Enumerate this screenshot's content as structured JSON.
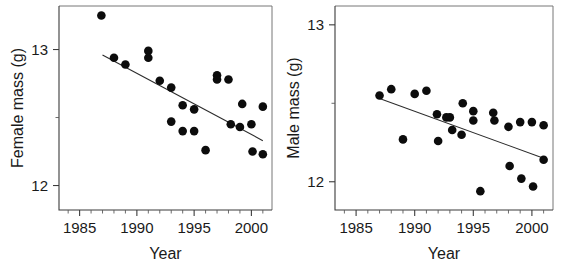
{
  "figure": {
    "panel_count": 2,
    "background": "#ffffff",
    "point_color": "#0c0c0c",
    "line_color": "#2b2b2b",
    "axis_color": "#3b3b3b"
  },
  "chart_data": [
    {
      "type": "scatter",
      "panel": "left",
      "title": "",
      "xlabel": "Year",
      "ylabel": "Female mass (g)",
      "xlim": [
        1983.2,
        2001.8
      ],
      "ylim": [
        11.82,
        13.32
      ],
      "grid": false,
      "legend": "none",
      "xticks": [
        1985,
        1990,
        1995,
        2000
      ],
      "xticklabels": [
        "1985",
        "1990",
        "1995",
        "2000"
      ],
      "xminorticks": [
        1984,
        1986,
        1987,
        1988,
        1989,
        1991,
        1992,
        1993,
        1994,
        1996,
        1997,
        1998,
        1999,
        2001
      ],
      "yticks": [
        12,
        13
      ],
      "yticklabels": [
        "12",
        "13"
      ],
      "yminorticks": [
        12.5
      ],
      "points": [
        {
          "x": 1986.9,
          "y": 13.25
        },
        {
          "x": 1988.0,
          "y": 12.94
        },
        {
          "x": 1989.0,
          "y": 12.89
        },
        {
          "x": 1991.0,
          "y": 12.99
        },
        {
          "x": 1991.0,
          "y": 12.94
        },
        {
          "x": 1992.0,
          "y": 12.77
        },
        {
          "x": 1993.0,
          "y": 12.72
        },
        {
          "x": 1993.0,
          "y": 12.47
        },
        {
          "x": 1994.0,
          "y": 12.59
        },
        {
          "x": 1994.0,
          "y": 12.4
        },
        {
          "x": 1995.0,
          "y": 12.56
        },
        {
          "x": 1995.0,
          "y": 12.4
        },
        {
          "x": 1996.0,
          "y": 12.26
        },
        {
          "x": 1997.0,
          "y": 12.81
        },
        {
          "x": 1997.0,
          "y": 12.78
        },
        {
          "x": 1998.0,
          "y": 12.78
        },
        {
          "x": 1998.2,
          "y": 12.45
        },
        {
          "x": 1999.0,
          "y": 12.43
        },
        {
          "x": 1999.2,
          "y": 12.6
        },
        {
          "x": 2000.0,
          "y": 12.45
        },
        {
          "x": 2000.1,
          "y": 12.25
        },
        {
          "x": 2001.0,
          "y": 12.58
        },
        {
          "x": 2001.0,
          "y": 12.23
        }
      ],
      "fit_line": {
        "x0": 1987.0,
        "y0": 12.96,
        "x1": 2001.0,
        "y1": 12.33,
        "description": "negative linear trend"
      }
    },
    {
      "type": "scatter",
      "panel": "right",
      "title": "",
      "xlabel": "Year",
      "ylabel": "Male mass (g)",
      "xlim": [
        1983.2,
        2001.8
      ],
      "ylim": [
        11.82,
        13.12
      ],
      "grid": false,
      "legend": "none",
      "xticks": [
        1985,
        1990,
        1995,
        2000
      ],
      "xticklabels": [
        "1985",
        "1990",
        "1995",
        "2000"
      ],
      "xminorticks": [
        1984,
        1986,
        1987,
        1988,
        1989,
        1991,
        1992,
        1993,
        1994,
        1996,
        1997,
        1998,
        1999,
        2001
      ],
      "yticks": [
        12,
        13
      ],
      "yticklabels": [
        "12",
        "13"
      ],
      "yminorticks": [
        12.5
      ],
      "points": [
        {
          "x": 1987.0,
          "y": 12.55
        },
        {
          "x": 1988.0,
          "y": 12.59
        },
        {
          "x": 1989.0,
          "y": 12.27
        },
        {
          "x": 1990.0,
          "y": 12.56
        },
        {
          "x": 1991.0,
          "y": 12.58
        },
        {
          "x": 1991.9,
          "y": 12.43
        },
        {
          "x": 1992.0,
          "y": 12.26
        },
        {
          "x": 1992.7,
          "y": 12.41
        },
        {
          "x": 1993.0,
          "y": 12.41
        },
        {
          "x": 1993.2,
          "y": 12.33
        },
        {
          "x": 1994.0,
          "y": 12.3
        },
        {
          "x": 1994.1,
          "y": 12.5
        },
        {
          "x": 1995.0,
          "y": 12.45
        },
        {
          "x": 1995.0,
          "y": 12.39
        },
        {
          "x": 1995.6,
          "y": 11.94
        },
        {
          "x": 1996.7,
          "y": 12.44
        },
        {
          "x": 1996.8,
          "y": 12.39
        },
        {
          "x": 1998.0,
          "y": 12.35
        },
        {
          "x": 1998.1,
          "y": 12.1
        },
        {
          "x": 1999.0,
          "y": 12.38
        },
        {
          "x": 1999.1,
          "y": 12.02
        },
        {
          "x": 2000.0,
          "y": 12.38
        },
        {
          "x": 2000.1,
          "y": 11.97
        },
        {
          "x": 2001.0,
          "y": 12.36
        },
        {
          "x": 2001.0,
          "y": 12.14
        }
      ],
      "fit_line": {
        "x0": 1987.0,
        "y0": 12.53,
        "x1": 2001.0,
        "y1": 12.15,
        "description": "negative linear trend"
      }
    }
  ]
}
